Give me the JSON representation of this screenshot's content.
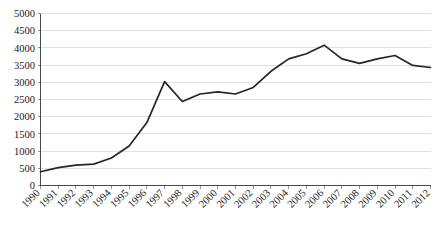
{
  "chart_data": {
    "type": "line",
    "title": "",
    "subtitle": "",
    "xlabel": "",
    "ylabel": "",
    "grid": true,
    "legend": false,
    "legend_position": "none",
    "line_color": "#262626",
    "gridline_color": "#d9d9d9",
    "axis_color": "#4a4a4a",
    "background_color": "#ffffff",
    "xlim": [
      1990,
      2012
    ],
    "ylim": [
      0,
      5000
    ],
    "ytick_step": 500,
    "ytick_labels": [
      "0",
      "500",
      "1000",
      "1500",
      "2000",
      "2500",
      "3000",
      "3500",
      "4000",
      "4500",
      "5000"
    ],
    "ytick_values": [
      0,
      500,
      1000,
      1500,
      2000,
      2500,
      3000,
      3500,
      4000,
      4500,
      5000
    ],
    "categories": [
      "1990",
      "1991",
      "1992",
      "1993",
      "1994",
      "1995",
      "1996",
      "1997",
      "1998",
      "1999",
      "2000",
      "2001",
      "2002",
      "2003",
      "2004",
      "2005",
      "2006",
      "2007",
      "2008",
      "2009",
      "2010",
      "2011",
      "2012"
    ],
    "x": [
      1990,
      1991,
      1992,
      1993,
      1994,
      1995,
      1996,
      1997,
      1998,
      1999,
      2000,
      2001,
      2002,
      2003,
      2004,
      2005,
      2006,
      2007,
      2008,
      2009,
      2010,
      2011,
      2012
    ],
    "values": [
      400,
      520,
      590,
      620,
      800,
      1150,
      1830,
      3020,
      2440,
      2660,
      2720,
      2660,
      2850,
      3320,
      3680,
      3830,
      4080,
      3680,
      3550,
      3680,
      3780,
      3490,
      3430
    ],
    "series": [
      {
        "name": "series-1",
        "color": "#262626",
        "values": [
          400,
          520,
          590,
          620,
          800,
          1150,
          1830,
          3020,
          2440,
          2660,
          2720,
          2660,
          2850,
          3320,
          3680,
          3830,
          4080,
          3680,
          3550,
          3680,
          3780,
          3490,
          3430
        ]
      }
    ],
    "annotations": []
  }
}
